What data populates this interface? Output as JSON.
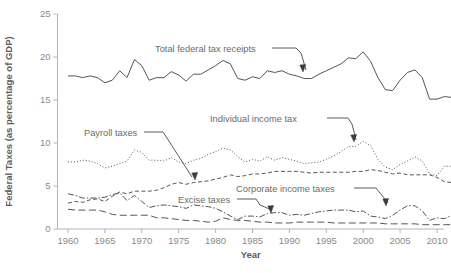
{
  "chart_data": {
    "type": "line",
    "title": "",
    "xlabel": "Year",
    "ylabel": "Federal Taxes (as percentage of GDP)",
    "xlim": [
      1958,
      2013
    ],
    "ylim": [
      0,
      25
    ],
    "xticks": [
      1960,
      1965,
      1970,
      1975,
      1980,
      1985,
      1990,
      1995,
      2000,
      2005,
      2010
    ],
    "xtick_labels": [
      "1960",
      "1965",
      "1970",
      "1975",
      "1980",
      "1985",
      "1990",
      "1995",
      "2000",
      "2005",
      "2010"
    ],
    "yticks": [
      0,
      5,
      10,
      15,
      20,
      25
    ],
    "ytick_labels": [
      "0",
      "5",
      "10",
      "15",
      "20",
      "25"
    ],
    "grid": false,
    "legend": "annotations",
    "x": [
      1960,
      1961,
      1962,
      1963,
      1964,
      1965,
      1966,
      1967,
      1968,
      1969,
      1970,
      1971,
      1972,
      1973,
      1974,
      1975,
      1976,
      1977,
      1978,
      1979,
      1980,
      1981,
      1982,
      1983,
      1984,
      1985,
      1986,
      1987,
      1988,
      1989,
      1990,
      1991,
      1992,
      1993,
      1994,
      1995,
      1996,
      1997,
      1998,
      1999,
      2000,
      2001,
      2002,
      2003,
      2004,
      2005,
      2006,
      2007,
      2008,
      2009,
      2010,
      2011,
      2012
    ],
    "series": [
      {
        "name": "Total federal tax receipts",
        "style": "solid",
        "color": "#555555",
        "values": [
          17.8,
          17.8,
          17.6,
          17.8,
          17.6,
          17.0,
          17.3,
          18.4,
          17.6,
          19.7,
          19.0,
          17.3,
          17.6,
          17.6,
          18.3,
          17.9,
          17.2,
          18.0,
          18.0,
          18.5,
          19.0,
          19.6,
          19.2,
          17.5,
          17.3,
          17.7,
          17.5,
          18.4,
          18.2,
          18.4,
          18.0,
          17.8,
          17.5,
          17.5,
          18.0,
          18.4,
          18.8,
          19.2,
          19.9,
          19.8,
          20.6,
          19.5,
          17.6,
          16.2,
          16.1,
          17.3,
          18.2,
          18.5,
          17.6,
          15.1,
          15.1,
          15.4,
          15.3
        ]
      },
      {
        "name": "Individual income tax",
        "style": "dotted",
        "color": "#777777",
        "values": [
          7.8,
          7.8,
          8.0,
          7.9,
          7.6,
          7.1,
          7.3,
          7.6,
          7.9,
          9.2,
          8.9,
          8.0,
          8.0,
          7.9,
          8.3,
          7.8,
          7.6,
          8.0,
          8.2,
          8.7,
          9.0,
          9.4,
          9.2,
          8.4,
          7.8,
          8.1,
          7.9,
          8.4,
          8.0,
          8.3,
          8.1,
          7.9,
          7.6,
          7.7,
          7.8,
          8.1,
          8.5,
          9.0,
          9.6,
          9.6,
          10.2,
          9.7,
          8.1,
          7.2,
          6.9,
          7.5,
          7.9,
          8.4,
          7.9,
          6.4,
          6.2,
          7.3,
          7.3
        ]
      },
      {
        "name": "Payroll taxes",
        "style": "shortdash",
        "color": "#555555",
        "values": [
          3.0,
          3.2,
          3.1,
          3.4,
          3.5,
          3.2,
          3.8,
          4.3,
          4.1,
          4.4,
          4.4,
          4.4,
          4.5,
          4.8,
          5.2,
          5.4,
          5.2,
          5.4,
          5.5,
          5.6,
          5.8,
          6.0,
          6.3,
          6.1,
          6.2,
          6.4,
          6.4,
          6.5,
          6.7,
          6.7,
          6.7,
          6.7,
          6.6,
          6.5,
          6.6,
          6.6,
          6.6,
          6.6,
          6.6,
          6.7,
          6.7,
          6.9,
          6.8,
          6.6,
          6.4,
          6.5,
          6.3,
          6.3,
          6.3,
          6.3,
          6.0,
          5.5,
          5.4
        ]
      },
      {
        "name": "Corporate income taxes",
        "style": "dashdot",
        "color": "#5a5a5a",
        "values": [
          4.1,
          3.9,
          3.6,
          3.6,
          3.6,
          3.7,
          4.0,
          4.2,
          3.3,
          3.9,
          3.2,
          2.5,
          2.7,
          2.8,
          2.7,
          2.6,
          2.4,
          2.8,
          2.7,
          2.6,
          2.4,
          2.0,
          1.5,
          1.1,
          1.5,
          1.5,
          1.4,
          1.8,
          1.9,
          1.9,
          1.6,
          1.7,
          1.6,
          1.8,
          2.0,
          2.1,
          2.2,
          2.2,
          2.2,
          2.0,
          2.1,
          1.5,
          1.4,
          1.2,
          1.6,
          2.2,
          2.7,
          2.7,
          2.1,
          1.0,
          1.3,
          1.2,
          1.6
        ]
      },
      {
        "name": "Excise taxes",
        "style": "longdash",
        "color": "#5a5a5a",
        "values": [
          2.3,
          2.2,
          2.2,
          2.2,
          2.2,
          2.0,
          1.7,
          1.6,
          1.6,
          1.6,
          1.6,
          1.6,
          1.3,
          1.3,
          1.2,
          1.1,
          1.0,
          1.0,
          0.9,
          0.8,
          0.9,
          1.3,
          1.1,
          1.0,
          1.0,
          0.9,
          0.8,
          0.8,
          0.7,
          0.7,
          0.7,
          0.8,
          0.8,
          0.8,
          0.8,
          0.8,
          0.7,
          0.7,
          0.7,
          0.7,
          0.7,
          0.7,
          0.7,
          0.6,
          0.6,
          0.6,
          0.6,
          0.6,
          0.5,
          0.5,
          0.5,
          0.5,
          0.5
        ]
      }
    ],
    "annotations": [
      {
        "label": "Total federal tax receipts",
        "x": 155,
        "y": 52,
        "lead": "M272,48 L296,48 L301,53 L306,70",
        "tip": "303,72"
      },
      {
        "label": "Individual income tax",
        "x": 210,
        "y": 122,
        "lead": "M327,118 L348,118 L352,124 L356,140",
        "tip": "354,142"
      },
      {
        "label": "Payroll taxes",
        "x": 84,
        "y": 136,
        "lead": "M144,132 L163,132 L167,138 L192,177",
        "tip": "195,180"
      },
      {
        "label": "Corporate income taxes",
        "x": 236,
        "y": 192,
        "lead": "M354,188 L376,188 L380,193 L388,203",
        "tip": "386,206"
      },
      {
        "label": "Excise taxes",
        "x": 178,
        "y": 203,
        "lead": "M237,199 L256,199 L260,205 L272,210",
        "tip": "271,213"
      }
    ]
  }
}
